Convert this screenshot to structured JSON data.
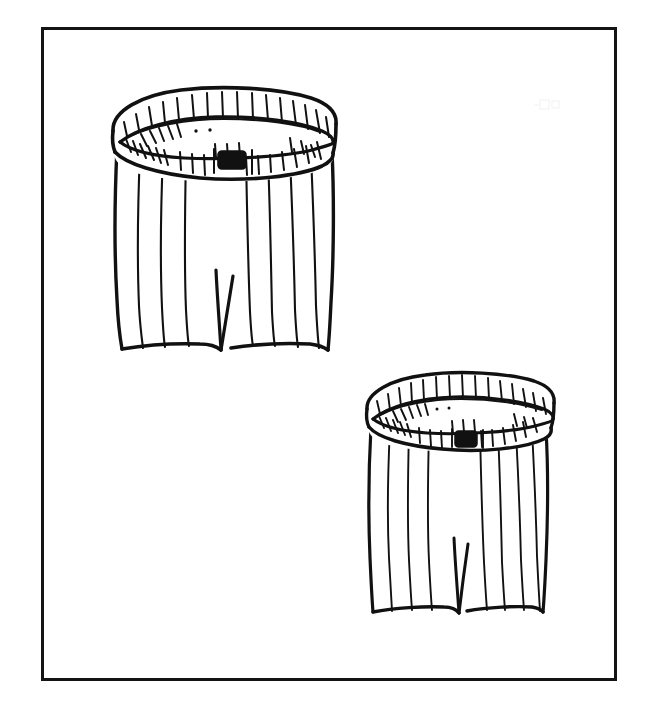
{
  "document": {
    "kind": "line-art-illustration",
    "title": "Striped Shorts Pair Line Drawing",
    "medium": "black ink pen line drawing on white paper",
    "background_color": "#ffffff",
    "ink_color": "#111111",
    "has_text": false,
    "text_content": "",
    "canvas": {
      "width": 649,
      "height": 708
    }
  },
  "frame": {
    "name": "rectangular-border",
    "x": 41,
    "y": 27,
    "width": 576,
    "height": 654,
    "stroke_color": "#141414",
    "stroke_width": 3,
    "fill": "#ffffff"
  },
  "objects": [
    {
      "id": "shorts-large",
      "label": "Striped shorts, larger, upper left",
      "size_label": "large",
      "position_label": "upper-left",
      "bbox": {
        "x": 110,
        "y": 86,
        "width": 226,
        "height": 266
      },
      "waistband": {
        "label": "waistband with hatch marks",
        "buckle": {
          "label": "dark rectangular buckle tab",
          "shape": "rounded-rectangle",
          "fill": "#111111",
          "cx": 232,
          "cy": 160,
          "width": 28,
          "height": 18
        },
        "hatch_count_outer": 17,
        "hatch_count_inner": 14,
        "dots": 2
      },
      "body": {
        "label": "shorts body with vertical pinstripes",
        "stripe_count": 9,
        "leg_split": {
          "label": "center inseam notch",
          "x": 222,
          "top": 272,
          "bottom": 348
        }
      }
    },
    {
      "id": "shorts-small",
      "label": "Striped shorts, smaller, lower right",
      "size_label": "small",
      "position_label": "lower-right",
      "bbox": {
        "x": 365,
        "y": 366,
        "width": 183,
        "height": 252
      },
      "waistband": {
        "label": "waistband with hatch marks",
        "buckle": {
          "label": "dark rectangular buckle tab",
          "shape": "rounded-rectangle",
          "fill": "#111111",
          "cx": 466,
          "cy": 439,
          "width": 22,
          "height": 16
        },
        "hatch_count_outer": 16,
        "hatch_count_inner": 13,
        "dots": 2
      },
      "body": {
        "label": "shorts body with vertical pinstripes",
        "stripe_count": 9,
        "leg_split": {
          "label": "center inseam notch",
          "x": 459,
          "top": 540,
          "bottom": 613
        }
      }
    }
  ],
  "artifacts": [
    {
      "label": "faint scan speck",
      "x": 545,
      "y": 105,
      "opacity": 0.08
    }
  ]
}
